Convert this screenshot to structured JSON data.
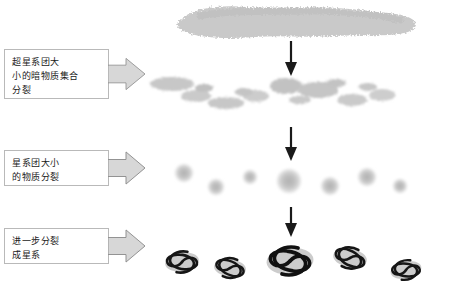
{
  "diagram": {
    "title": "",
    "stages": [
      {
        "id": "stage-1",
        "label": "超星系团大\n小的暗物质集合\n分裂",
        "visual": "elongated-filament-cloud"
      },
      {
        "id": "stage-2",
        "label": "星系团大小\n的物质分裂",
        "visual": "fragmented-clumps-row"
      },
      {
        "id": "stage-3",
        "label": "进一步分裂\n成星系",
        "visual": "round-clumps-row"
      },
      {
        "id": "stage-4",
        "label": "",
        "visual": "spiral-galaxies-row"
      }
    ],
    "arrows": {
      "down_arrow_label": "向下箭头",
      "tail_arrow_label": "指向右的箭头"
    },
    "colors": {
      "cloud_fill": "#c9c9c9",
      "clump_fill": "#bdbdbd",
      "galaxy_core": "#1a1a1a",
      "arrow_fill": "#d7d7d7",
      "arrow_stroke": "#8f8f8f",
      "box_border": "#b9b9b9",
      "text": "#1a1a1a"
    }
  }
}
